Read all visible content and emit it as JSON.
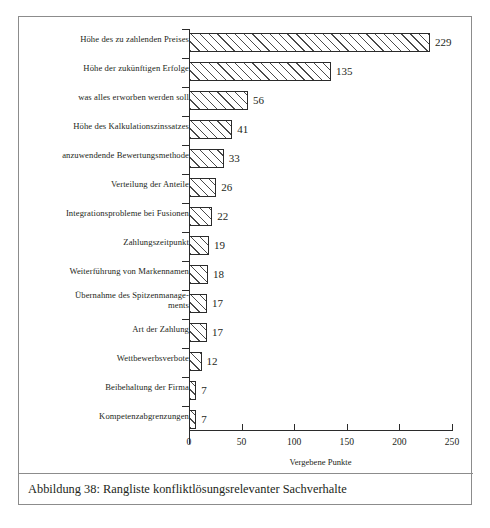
{
  "figure": {
    "caption": "Abbildung 38: Rangliste konfliktlösungsrelevanter Sachverhalte"
  },
  "chart_data": {
    "type": "bar",
    "orientation": "horizontal",
    "title": "",
    "xlabel": "Vergebene Punkte",
    "ylabel": "",
    "xlim": [
      0,
      250
    ],
    "xticks": [
      0,
      50,
      100,
      150,
      200,
      250
    ],
    "grid": false,
    "legend": null,
    "bar_style": {
      "fill": "#ffffff",
      "hatch": "/",
      "edge_color": "#2b2b2b"
    },
    "categories": [
      "Höhe des zu zahlenden Preises",
      "Höhe der zukünftigen Erfolge",
      "was alles erworben werden soll",
      "Höhe des Kalkulationszinssatzes",
      "anzuwendende Bewertungsmethode",
      "Verteilung der Anteile",
      "Integrationsprobleme bei Fusionen",
      "Zahlungszeitpunkt",
      "Weiterführung von Markennamen",
      "Übernahme des Spitzenmanage-\nments",
      "Art der Zahlung",
      "Wettbewerbsverbote",
      "Beibehaltung der Firma",
      "Kompetenzabgrenzungen"
    ],
    "values": [
      229,
      135,
      56,
      41,
      33,
      26,
      22,
      19,
      18,
      17,
      17,
      12,
      7,
      7
    ],
    "value_labels": [
      "229",
      "135",
      "56",
      "41",
      "33",
      "26",
      "22",
      "19",
      "18",
      "17",
      "17",
      "12",
      "7",
      "7"
    ],
    "xtick_labels": [
      "0",
      "50",
      "100",
      "150",
      "200",
      "250"
    ]
  }
}
